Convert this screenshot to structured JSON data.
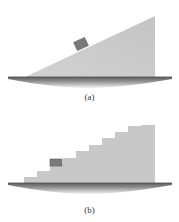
{
  "figure_a": {
    "caption": "(a)",
    "description": "block on a smooth inclined plane (ramp)"
  },
  "figure_b": {
    "caption": "(b)",
    "description": "block on a staircase",
    "step_count": 8
  },
  "colors": {
    "ramp_fill": "#c8c8c8",
    "block_fill": "#7a7a7a",
    "block_stroke": "#5a5a5a",
    "ground_top": "#6e6e6e",
    "ground_bottom": "#dddddd",
    "caption_text": "#333333"
  }
}
